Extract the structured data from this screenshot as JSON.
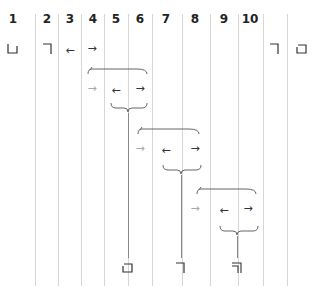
{
  "columns": {
    "headers": [
      "1",
      "2",
      "3",
      "4",
      "5",
      "6",
      "7",
      "8",
      "9",
      "10"
    ]
  },
  "row1": {
    "left_box": "□",
    "left_corner": "⏋",
    "left_arrow": "←",
    "right_arrow": "→",
    "right_corner": "⏋",
    "right_box": "□"
  },
  "level1": {
    "in_arrow": "→",
    "left_arrow": "←",
    "right_arrow": "→",
    "result_symbol": "□"
  },
  "level2": {
    "in_arrow": "→",
    "left_arrow": "←",
    "right_arrow": "→",
    "result_symbol": "⏋"
  },
  "level3": {
    "in_arrow": "→",
    "left_arrow": "←",
    "right_arrow": "→",
    "result_symbol": "╗"
  },
  "colors": {
    "grid_line": "#d6d6d6",
    "ink": "#333333",
    "muted_arrow": "#aaaaaa",
    "brace": "#666666"
  }
}
